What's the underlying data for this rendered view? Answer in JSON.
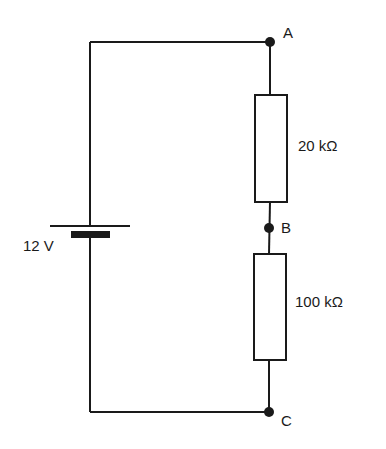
{
  "diagram": {
    "type": "circuit",
    "battery": {
      "label": "12 V"
    },
    "nodes": {
      "a": "A",
      "b": "B",
      "c": "C"
    },
    "resistors": [
      {
        "label": "20 kΩ"
      },
      {
        "label": "100 kΩ"
      }
    ],
    "colors": {
      "stroke": "#1a1a1a",
      "background": "#ffffff"
    }
  }
}
